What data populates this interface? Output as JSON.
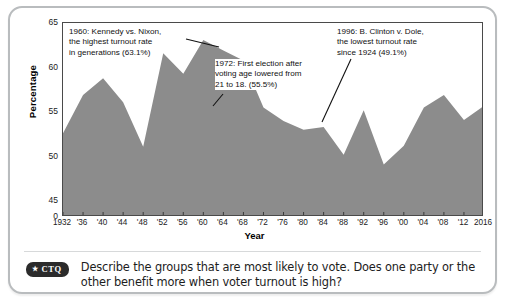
{
  "card": {
    "y_axis_title": "Percentage",
    "x_axis_title": "Year"
  },
  "annotations": [
    {
      "id": "annot-1960",
      "text": "1960: Kennedy vs. Nixon,\nthe highest turnout rate\nin generations (63.1%)"
    },
    {
      "id": "annot-1972",
      "text": "1972: First election after\nvoting age lowered from\n21 to 18. (55.5%)"
    },
    {
      "id": "annot-1996",
      "text": "1996: B. Clinton v. Dole,\nthe lowest turnout rate\nsince 1924 (49.1%)"
    }
  ],
  "question": {
    "badge_star": "★",
    "badge_label": "CTQ",
    "text": "Describe the groups that are most likely to vote. Does one party or the other benefit more when voter turnout is high?"
  },
  "colors": {
    "area_fill": "#8c8c8c",
    "frame": "#4a4a4a",
    "card_border": "#b9bcbe",
    "badge_bg": "#2b2b2b"
  },
  "chart_data": {
    "type": "area",
    "title": "",
    "xlabel": "Year",
    "ylabel": "Percentage",
    "xlim": [
      1932,
      2016
    ],
    "ylim": [
      43.2,
      65
    ],
    "y_axis_broken": true,
    "ytick_labels": [
      "0",
      "45",
      "50",
      "55",
      "60",
      "65"
    ],
    "ytick_values": [
      43.2,
      45,
      50,
      55,
      60,
      65
    ],
    "xtick_labels": [
      "1932",
      "'36",
      "'40",
      "'44",
      "'48",
      "'52",
      "'56",
      "'60",
      "'64",
      "'68",
      "'72",
      "'76",
      "'80",
      "'84",
      "'88",
      "'92",
      "'96",
      "'00",
      "'04",
      "'08",
      "'12",
      "2016"
    ],
    "xtick_values": [
      1932,
      1936,
      1940,
      1944,
      1948,
      1952,
      1956,
      1960,
      1964,
      1968,
      1972,
      1976,
      1980,
      1984,
      1988,
      1992,
      1996,
      2000,
      2004,
      2008,
      2012,
      2016
    ],
    "grid": false,
    "legend": "none",
    "x": [
      1932,
      1936,
      1940,
      1944,
      1948,
      1952,
      1956,
      1960,
      1964,
      1968,
      1972,
      1976,
      1980,
      1984,
      1988,
      1992,
      1996,
      2000,
      2004,
      2008,
      2012,
      2016
    ],
    "values": [
      52.6,
      56.9,
      58.8,
      56.1,
      51.1,
      61.6,
      59.3,
      63.1,
      61.9,
      60.8,
      55.5,
      54.0,
      53.0,
      53.3,
      50.2,
      55.2,
      49.1,
      51.2,
      55.5,
      56.9,
      54.1,
      55.7
    ]
  }
}
